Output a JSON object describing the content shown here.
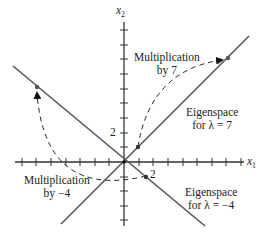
{
  "axes": {
    "x_label": "x",
    "x_sub": "1",
    "y_label": "x",
    "y_sub": "2",
    "x_tick_label": "2",
    "y_tick_label": "2"
  },
  "annotations": {
    "mult7_line1": "Multiplication",
    "mult7_line2": "by 7",
    "multm4_line1": "Multiplication",
    "multm4_line2": "by −4",
    "eig7_line1": "Eigenspace",
    "eig7_line2": "for λ = 7",
    "eigm4_line1": "Eigenspace",
    "eigm4_line2": "for λ = −4"
  },
  "colors": {
    "axis": "#333333",
    "eigenline": "#555555",
    "dashed": "#222222"
  }
}
